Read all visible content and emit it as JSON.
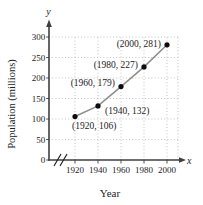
{
  "figure": {
    "x_axis_letter": "x",
    "y_axis_letter": "y",
    "x_axis_title": "Year",
    "y_axis_title": "Population (millions)"
  },
  "chart_data": {
    "type": "scatter",
    "title": "",
    "xlabel": "Year",
    "ylabel": "Population (millions)",
    "x": [
      1920,
      1940,
      1960,
      1980,
      2000
    ],
    "y": [
      106,
      132,
      179,
      227,
      281
    ],
    "point_labels": [
      "(1920, 106)",
      "(1940, 132)",
      "(1960, 179)",
      "(1980, 227)",
      "(2000, 281)"
    ],
    "label_placement": [
      {
        "side": "below",
        "dy": 0
      },
      {
        "side": "right",
        "dy": 0
      },
      {
        "side": "left",
        "dy": -1
      },
      {
        "side": "left",
        "dy": 1
      },
      {
        "side": "left",
        "dy": 2
      }
    ],
    "x_ticks": [
      1920,
      1940,
      1960,
      1980,
      2000
    ],
    "y_ticks": [
      0,
      50,
      100,
      150,
      200,
      250,
      300
    ],
    "xlim": [
      1920,
      2000
    ],
    "ylim": [
      0,
      300
    ],
    "grid": true,
    "grid_style": "dotted",
    "x_axis_break": true,
    "line_connects_points": true,
    "colors": {
      "axis": "#3f3f3f",
      "grid": "#bdbdbd",
      "line": "#8f8f8f",
      "point": "#0d0d0d",
      "text": "#1c1c1c"
    }
  }
}
